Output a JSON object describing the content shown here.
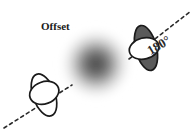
{
  "figure": {
    "title": "Offset",
    "background_color": "#ffffff",
    "labels": {
      "offset": "Offset",
      "angle": "180°"
    },
    "colors": {
      "outline": "#1a1a1a",
      "filled_lobe": "#5a5a5a",
      "unfilled_lobe": "#ffffff",
      "blob_center": "#5e5e5e",
      "dashed_line": "#2b2b2b",
      "text": "#1a1a1a"
    },
    "blob": {
      "name": "diffuse-source",
      "center_x": 96,
      "center_y": 64,
      "radius": 40,
      "center_gray": "#5e5e5e"
    },
    "beams": [
      {
        "name": "lower-left-beam",
        "position_x": 44,
        "position_y": 95,
        "rotation_deg": -22,
        "lobe_fill": "#ffffff",
        "is_filled": false,
        "dash_from_x": 6,
        "dash_from_y": 127,
        "dash_to_x": 70,
        "dash_to_y": 86
      },
      {
        "name": "upper-right-beam",
        "position_x": 146,
        "position_y": 48,
        "rotation_deg": -22,
        "lobe_fill": "#5a5a5a",
        "is_filled": true,
        "dash_from_x": 130,
        "dash_from_y": 58,
        "dash_to_x": 190,
        "dash_to_y": 12
      }
    ],
    "angle_label": {
      "text": "180°",
      "x": 161,
      "y": 48,
      "rotation_deg": -31
    },
    "offset_label": {
      "text": "Offset",
      "x": 41,
      "y": 30
    }
  }
}
